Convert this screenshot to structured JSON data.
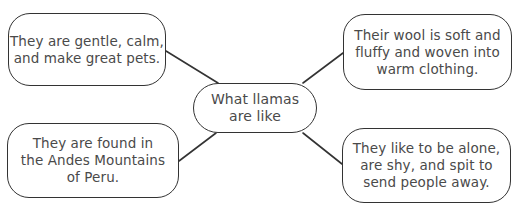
{
  "diagram": {
    "type": "concept-web",
    "center": {
      "text": "What llamas\nare like"
    },
    "nodes": [
      {
        "id": "top-left",
        "text": "They are gentle, calm,\nand make great pets."
      },
      {
        "id": "top-right",
        "text": "Their wool is soft and\nfluffy and woven into\nwarm clothing."
      },
      {
        "id": "bottom-left",
        "text": "They are found in\nthe Andes Mountains\nof Peru."
      },
      {
        "id": "bottom-right",
        "text": "They like to be alone,\nare shy, and spit to\nsend people away."
      }
    ],
    "edges": [
      {
        "from": "center",
        "to": "top-left"
      },
      {
        "from": "center",
        "to": "top-right"
      },
      {
        "from": "center",
        "to": "bottom-left"
      },
      {
        "from": "center",
        "to": "bottom-right"
      }
    ]
  }
}
